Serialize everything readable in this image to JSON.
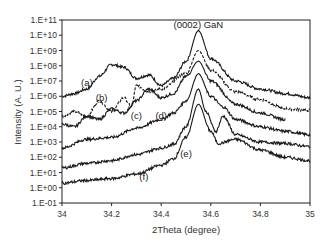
{
  "chart_data": {
    "type": "line",
    "title": "",
    "xlabel": "2Theta (degree)",
    "ylabel": "Intensity (A. U.)",
    "xlim": [
      34,
      35
    ],
    "ylim": [
      0.1,
      100000000000
    ],
    "yscale": "log",
    "grid": false,
    "legend": "none (curves labeled inline)",
    "x_ticks": [
      "34",
      "34.2",
      "34.4",
      "34.6",
      "34.8",
      "35"
    ],
    "y_ticks": [
      "1.E-01",
      "1.E+00",
      "1.E+01",
      "1.E+02",
      "1.E+03",
      "1.E+04",
      "1.E+05",
      "1.E+06",
      "1.E+07",
      "1.E+08",
      "1.E+09",
      "1.E+10",
      "1.E+11"
    ],
    "annotations": [
      {
        "text": "(0002) GaN",
        "x": 34.55,
        "y": 30000000000
      },
      {
        "text": "(a)",
        "x": 34.1,
        "y": 5000000
      },
      {
        "text": "(b)",
        "x": 34.16,
        "y": 500000
      },
      {
        "text": "(c)",
        "x": 34.3,
        "y": 30000
      },
      {
        "text": "(d)",
        "x": 34.4,
        "y": 30000
      },
      {
        "text": "(e)",
        "x": 34.5,
        "y": 100
      },
      {
        "text": "(f)",
        "x": 34.33,
        "y": 3
      }
    ],
    "series": [
      {
        "name": "(a)",
        "style": "solid",
        "peak_x": 34.55,
        "peak_y": 20000000000,
        "points": [
          [
            34.0,
            1000000
          ],
          [
            34.05,
            1500000
          ],
          [
            34.1,
            3000000
          ],
          [
            34.15,
            20000000
          ],
          [
            34.2,
            120000000
          ],
          [
            34.25,
            80000000
          ],
          [
            34.3,
            15000000
          ],
          [
            34.35,
            25000000
          ],
          [
            34.4,
            5000000
          ],
          [
            34.45,
            15000000
          ],
          [
            34.5,
            200000000
          ],
          [
            34.55,
            20000000000
          ],
          [
            34.6,
            300000000
          ],
          [
            34.7,
            10000000
          ],
          [
            34.8,
            3000000
          ],
          [
            34.9,
            1500000
          ],
          [
            35.0,
            800000
          ]
        ]
      },
      {
        "name": "(b)",
        "style": "dashed-oscillating",
        "peak_x": 34.55,
        "peak_y": 1000000000,
        "points": [
          [
            34.0,
            50000
          ],
          [
            34.05,
            100000
          ],
          [
            34.1,
            50000
          ],
          [
            34.15,
            500000
          ],
          [
            34.2,
            100000
          ],
          [
            34.25,
            800000
          ],
          [
            34.28,
            200000
          ],
          [
            34.3,
            5000000
          ],
          [
            34.35,
            2000000
          ],
          [
            34.4,
            3000000
          ],
          [
            34.5,
            30000000
          ],
          [
            34.55,
            1000000000
          ],
          [
            34.6,
            50000000
          ],
          [
            34.7,
            2000000
          ],
          [
            34.8,
            600000
          ],
          [
            34.9,
            150000
          ],
          [
            35.0,
            120000
          ]
        ]
      },
      {
        "name": "(c)",
        "style": "solid",
        "peak_x": 34.55,
        "peak_y": 200000000,
        "points": [
          [
            34.0,
            15000
          ],
          [
            34.05,
            10000
          ],
          [
            34.1,
            50000
          ],
          [
            34.15,
            30000
          ],
          [
            34.2,
            150000
          ],
          [
            34.25,
            80000
          ],
          [
            34.3,
            500000
          ],
          [
            34.35,
            3000000
          ],
          [
            34.4,
            800000
          ],
          [
            34.45,
            1500000
          ],
          [
            34.5,
            20000000
          ],
          [
            34.55,
            200000000
          ],
          [
            34.6,
            10000000
          ],
          [
            34.7,
            300000
          ],
          [
            34.8,
            80000
          ],
          [
            34.9,
            30000
          ]
        ]
      },
      {
        "name": "(d)",
        "style": "solid",
        "peak_x": 34.55,
        "peak_y": 30000000,
        "points": [
          [
            34.0,
            400
          ],
          [
            34.1,
            1500
          ],
          [
            34.2,
            2000
          ],
          [
            34.3,
            8000
          ],
          [
            34.4,
            30000
          ],
          [
            34.45,
            80000
          ],
          [
            34.5,
            500000
          ],
          [
            34.55,
            30000000
          ],
          [
            34.6,
            1000000
          ],
          [
            34.65,
            200000
          ],
          [
            34.7,
            30000
          ],
          [
            34.8,
            10000
          ],
          [
            34.9,
            5000
          ],
          [
            35.0,
            3000
          ]
        ]
      },
      {
        "name": "(e)",
        "style": "solid",
        "peak_x": 34.55,
        "peak_y": 3000000,
        "points": [
          [
            34.0,
            20
          ],
          [
            34.1,
            40
          ],
          [
            34.2,
            60
          ],
          [
            34.3,
            150
          ],
          [
            34.4,
            400
          ],
          [
            34.45,
            700
          ],
          [
            34.5,
            10000
          ],
          [
            34.55,
            3000000
          ],
          [
            34.58,
            100000
          ],
          [
            34.62,
            5000
          ],
          [
            34.65,
            50000
          ],
          [
            34.7,
            3000
          ],
          [
            34.8,
            1000
          ],
          [
            34.9,
            800
          ],
          [
            35.0,
            500
          ]
        ]
      },
      {
        "name": "(f)",
        "style": "solid",
        "peak_x": 34.55,
        "peak_y": 300000,
        "points": [
          [
            34.0,
            2
          ],
          [
            34.1,
            3
          ],
          [
            34.2,
            4
          ],
          [
            34.3,
            8
          ],
          [
            34.4,
            30
          ],
          [
            34.45,
            80
          ],
          [
            34.5,
            2000
          ],
          [
            34.55,
            300000
          ],
          [
            34.6,
            5000
          ],
          [
            34.63,
            800
          ],
          [
            34.7,
            1500
          ],
          [
            34.8,
            300
          ],
          [
            34.9,
            100
          ],
          [
            35.0,
            60
          ]
        ]
      }
    ]
  }
}
